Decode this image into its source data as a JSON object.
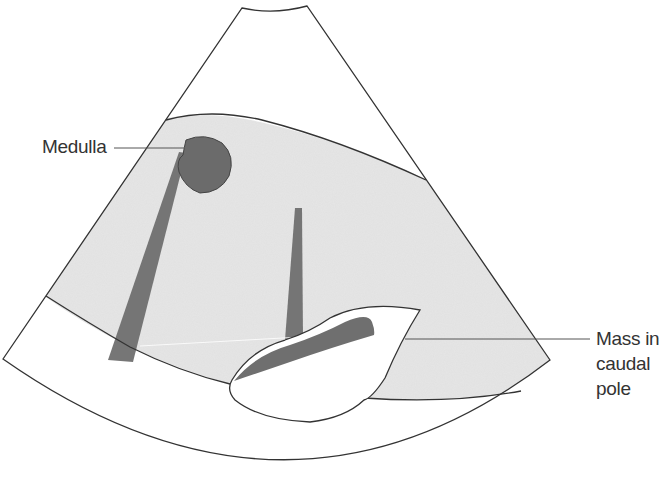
{
  "figure": {
    "type": "ultrasound-schematic",
    "colors": {
      "background": "#ffffff",
      "outline": "#333333",
      "parenchyma_fill": "#e6e6e6",
      "hypoechoic_fill": "#6f6f6f",
      "mass_fill": "#ffffff",
      "label_text": "#333333"
    }
  },
  "labels": {
    "medulla": "Medulla",
    "mass": {
      "line1": "Mass in",
      "line2": "caudal",
      "line3": "pole"
    }
  },
  "structures": [
    {
      "name": "scan-sector",
      "kind": "outline"
    },
    {
      "name": "kidney-parenchyma",
      "kind": "grey-fill"
    },
    {
      "name": "medulla",
      "kind": "dark-fill"
    },
    {
      "name": "acoustic-shadow-left",
      "kind": "dark-band"
    },
    {
      "name": "acoustic-shadow-center",
      "kind": "dark-band"
    },
    {
      "name": "caudal-pole-mass",
      "kind": "white-fill"
    },
    {
      "name": "mass-hypoechoic-crescent",
      "kind": "dark-fill"
    }
  ]
}
